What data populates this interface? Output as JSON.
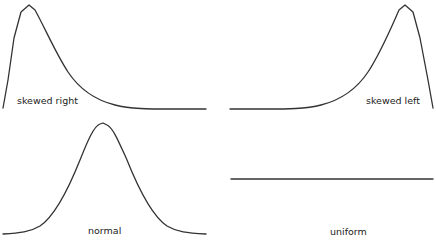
{
  "diagram": {
    "title": "",
    "stroke_color": "#333333",
    "background": "#ffffff",
    "panels": [
      {
        "id": "skewed-right",
        "label": "skewed right",
        "shape": "right-skewed distribution curve"
      },
      {
        "id": "skewed-left",
        "label": "skewed left",
        "shape": "left-skewed distribution curve"
      },
      {
        "id": "normal",
        "label": "normal",
        "shape": "symmetric bell curve"
      },
      {
        "id": "uniform",
        "label": "uniform",
        "shape": "flat horizontal line"
      }
    ]
  }
}
